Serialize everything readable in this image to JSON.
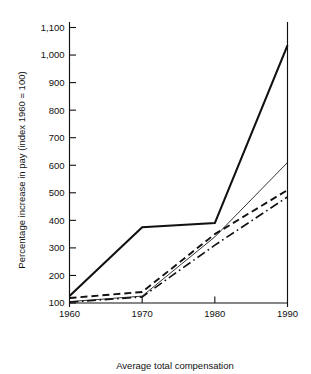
{
  "chart_data": {
    "type": "line",
    "title": "",
    "xlabel": "Average total compensation",
    "ylabel": "Percentage increase in pay (index 1960 = 100)",
    "x": [
      1960,
      1970,
      1980,
      1990
    ],
    "xticklabels": [
      "1960",
      "1970",
      "1980",
      "1990"
    ],
    "yticks": [
      100,
      200,
      300,
      400,
      500,
      600,
      700,
      800,
      900,
      1000,
      1100
    ],
    "yticklabels": [
      "100",
      "200",
      "300",
      "400",
      "500",
      "600",
      "700",
      "800",
      "900",
      "1,000",
      "1,100"
    ],
    "ylim": [
      100,
      1150
    ],
    "xlim": [
      1960,
      1990
    ],
    "grid": false,
    "legend": "none",
    "series": [
      {
        "name": "series-1",
        "style": "solid-thick",
        "stroke_width": 2.1,
        "dash": "none",
        "color": "#111111",
        "values": [
          125,
          375,
          390,
          1035
        ]
      },
      {
        "name": "series-2",
        "style": "solid-thin",
        "stroke_width": 0.85,
        "dash": "none",
        "color": "#111111",
        "values": [
          105,
          125,
          340,
          610
        ]
      },
      {
        "name": "series-3",
        "style": "dashed",
        "stroke_width": 1.9,
        "dash": "7,4",
        "color": "#111111",
        "values": [
          118,
          140,
          350,
          510
        ]
      },
      {
        "name": "series-4",
        "style": "dash-dot",
        "stroke_width": 1.6,
        "dash": "9,3.5,1.6,3.5",
        "color": "#111111",
        "values": [
          103,
          122,
          310,
          485
        ]
      }
    ]
  }
}
